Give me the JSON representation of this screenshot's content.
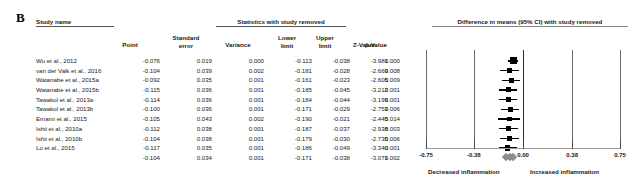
{
  "panel": {
    "letter": "B"
  },
  "table": {
    "group_headers": {
      "study_name": "Study name",
      "stats": "Statistics with study removed"
    },
    "columns": [
      {
        "key": "point",
        "label": "Point"
      },
      {
        "key": "se",
        "label": "Standard\nerror"
      },
      {
        "key": "variance",
        "label": "Variance"
      },
      {
        "key": "lower",
        "label": "Lower\nlimit"
      },
      {
        "key": "upper",
        "label": "Upper\nlimit"
      },
      {
        "key": "z",
        "label": "Z-Value"
      },
      {
        "key": "p",
        "label": "p-Value"
      }
    ],
    "column_labels": {
      "point": "Point",
      "se_line1": "Standard",
      "se_line2": "error",
      "variance": "Variance",
      "lower_line1": "Lower",
      "lower_line2": "limit",
      "upper_line1": "Upper",
      "upper_line2": "limit",
      "z": "Z-Value",
      "p": "p-Value"
    },
    "rows": [
      {
        "name": "Wu et al., 2012",
        "point": "-0.076",
        "se": "0.019",
        "variance": "0.000",
        "lower": "-0.113",
        "upper": "-0.038",
        "z": "-3.981",
        "p": "0.000"
      },
      {
        "name": "van der Valk et al., 2016",
        "point": "-0.104",
        "se": "0.039",
        "variance": "0.002",
        "lower": "-0.181",
        "upper": "-0.028",
        "z": "-2.669",
        "p": "0.008"
      },
      {
        "name": "Watanabe et al., 2015a",
        "point": "-0.092",
        "se": "0.035",
        "variance": "0.001",
        "lower": "-0.161",
        "upper": "-0.023",
        "z": "-2.605",
        "p": "0.009"
      },
      {
        "name": "Watanabe et al., 2015b",
        "point": "-0.115",
        "se": "0.036",
        "variance": "0.001",
        "lower": "-0.185",
        "upper": "-0.045",
        "z": "-3.212",
        "p": "0.001"
      },
      {
        "name": "Tawakol et al., 2013a",
        "point": "-0.114",
        "se": "0.036",
        "variance": "0.001",
        "lower": "-0.184",
        "upper": "-0.044",
        "z": "-3.199",
        "p": "0.001"
      },
      {
        "name": "Tawakol et al., 2013b",
        "point": "-0.100",
        "se": "0.036",
        "variance": "0.001",
        "lower": "-0.171",
        "upper": "-0.029",
        "z": "-2.753",
        "p": "0.006"
      },
      {
        "name": "Emami et al., 2015",
        "point": "-0.105",
        "se": "0.043",
        "variance": "0.002",
        "lower": "-0.190",
        "upper": "-0.021",
        "z": "-2.445",
        "p": "0.014"
      },
      {
        "name": "Ishii et al., 2010a",
        "point": "-0.112",
        "se": "0.038",
        "variance": "0.001",
        "lower": "-0.187",
        "upper": "-0.037",
        "z": "-2.938",
        "p": "0.003"
      },
      {
        "name": "Ishii et al., 2010b",
        "point": "-0.104",
        "se": "0.038",
        "variance": "0.001",
        "lower": "-0.179",
        "upper": "-0.030",
        "z": "-2.735",
        "p": "0.006"
      },
      {
        "name": "Lo et al., 2015",
        "point": "-0.117",
        "se": "0.035",
        "variance": "0.001",
        "lower": "-0.186",
        "upper": "-0.049",
        "z": "-3.340",
        "p": "0.001"
      },
      {
        "name": "",
        "point": "-0.104",
        "se": "0.034",
        "variance": "0.001",
        "lower": "-0.171",
        "upper": "-0.038",
        "z": "-3.071",
        "p": "0.002",
        "summary": true
      }
    ]
  },
  "plot": {
    "title": "Difference in means (95% CI) with study removed",
    "axis": {
      "ticks": [
        "-0.75",
        "-0.38",
        "0.00",
        "0.38",
        "0.75"
      ],
      "tick_values": [
        -0.75,
        -0.38,
        0.0,
        0.38,
        0.75
      ],
      "min": -0.75,
      "max": 0.75
    },
    "left_note": "Decreased inflammation",
    "right_note": "Increased inflammation",
    "marker_color": "#000000",
    "summary_color": "#8d8d8d"
  },
  "chart_data": {
    "type": "forest",
    "title": "Difference in means (95% CI) with study removed",
    "xlabel": "",
    "xlim": [
      -0.75,
      0.75
    ],
    "xticks": [
      -0.75,
      -0.38,
      0.0,
      0.38,
      0.75
    ],
    "grid": false,
    "reference_line": 0.0,
    "left_annotation": "Decreased inflammation",
    "right_annotation": "Increased inflammation",
    "categories": [
      "Wu et al., 2012",
      "van der Valk et al., 2016",
      "Watanabe et al., 2015a",
      "Watanabe et al., 2015b",
      "Tawakol et al., 2013a",
      "Tawakol et al., 2013b",
      "Emami et al., 2015",
      "Ishii et al., 2010a",
      "Ishii et al., 2010b",
      "Lo et al., 2015",
      "Overall"
    ],
    "point_estimates": [
      -0.076,
      -0.104,
      -0.092,
      -0.115,
      -0.114,
      -0.1,
      -0.105,
      -0.112,
      -0.104,
      -0.117,
      -0.104
    ],
    "lower_limits": [
      -0.113,
      -0.181,
      -0.161,
      -0.185,
      -0.184,
      -0.171,
      -0.19,
      -0.187,
      -0.179,
      -0.186,
      -0.171
    ],
    "upper_limits": [
      -0.038,
      -0.028,
      -0.023,
      -0.045,
      -0.044,
      -0.029,
      -0.021,
      -0.037,
      -0.03,
      -0.049,
      -0.038
    ],
    "standard_errors": [
      0.019,
      0.039,
      0.035,
      0.036,
      0.036,
      0.036,
      0.043,
      0.038,
      0.038,
      0.035,
      0.034
    ],
    "variances": [
      0.0,
      0.002,
      0.001,
      0.001,
      0.001,
      0.001,
      0.002,
      0.001,
      0.001,
      0.001,
      0.001
    ],
    "z_values": [
      -3.981,
      -2.669,
      -2.605,
      -3.212,
      -3.199,
      -2.753,
      -2.445,
      -2.938,
      -2.735,
      -3.34,
      -3.071
    ],
    "p_values": [
      0.0,
      0.008,
      0.009,
      0.001,
      0.001,
      0.006,
      0.014,
      0.003,
      0.006,
      0.001,
      0.002
    ]
  }
}
